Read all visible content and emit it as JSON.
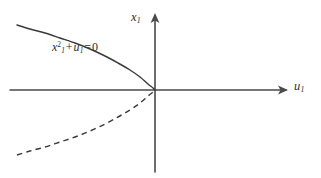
{
  "figure": {
    "background_color": "#ffffff",
    "stroke_color": "#3a3a3a",
    "axis_color": "#4a4a4a",
    "width": 321,
    "height": 178
  },
  "axes": {
    "x_axis": {
      "label": "u",
      "label_subscript": "1",
      "name": "u1",
      "arrow": "right"
    },
    "y_axis": {
      "label": "x",
      "label_subscript": "1",
      "name": "x1",
      "arrow": "up"
    },
    "origin": {
      "x": 155,
      "y": 90
    }
  },
  "annotations": {
    "curve_equation": {
      "variable": "x",
      "subscript": "1",
      "exponent": "2",
      "operator_plus": "+",
      "variable2": "u",
      "subscript2": "1",
      "operator_equals": "=",
      "value": "0",
      "plain_text": "x1^2 + u1 = 0"
    }
  },
  "chart_data": {
    "type": "line",
    "title": "",
    "xlabel": "u1",
    "ylabel": "x1",
    "grid": false,
    "legend": null,
    "equation": "x1^2 + u1 = 0",
    "series": [
      {
        "name": "upper-branch-solid",
        "style": "solid",
        "points_px": [
          [
            17,
            25
          ],
          [
            30,
            29
          ],
          [
            45,
            33
          ],
          [
            60,
            38
          ],
          [
            75,
            43
          ],
          [
            90,
            49
          ],
          [
            105,
            56
          ],
          [
            118,
            63
          ],
          [
            130,
            70
          ],
          [
            140,
            77
          ],
          [
            148,
            84
          ],
          [
            153,
            88
          ],
          [
            155,
            90
          ]
        ]
      },
      {
        "name": "lower-branch-dashed",
        "style": "dashed",
        "points_px": [
          [
            17,
            155
          ],
          [
            30,
            151
          ],
          [
            45,
            147
          ],
          [
            60,
            142
          ],
          [
            75,
            137
          ],
          [
            90,
            131
          ],
          [
            105,
            124
          ],
          [
            118,
            117
          ],
          [
            130,
            110
          ],
          [
            140,
            103
          ],
          [
            148,
            96
          ],
          [
            153,
            92
          ],
          [
            155,
            90
          ]
        ]
      }
    ]
  }
}
